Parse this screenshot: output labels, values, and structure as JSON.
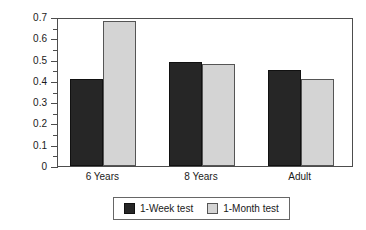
{
  "chart_data": {
    "type": "bar",
    "title": "",
    "subtitle": "",
    "xlabel": "",
    "ylabel": "False-Recall Probability",
    "categories": [
      "6 Years",
      "8 Years",
      "Adult"
    ],
    "series": [
      {
        "name": "1-Week test",
        "color": "#262626",
        "values": [
          0.41,
          0.49,
          0.45
        ]
      },
      {
        "name": "1-Month test",
        "color": "#d4d4d4",
        "values": [
          0.68,
          0.48,
          0.41
        ]
      }
    ],
    "ylim": [
      0,
      0.7
    ],
    "ytick_values": [
      0,
      0.1,
      0.2,
      0.3,
      0.4,
      0.5,
      0.6,
      0.7
    ],
    "ytick_labels": [
      "0",
      "0.1",
      "0.2",
      "0.3",
      "0.4",
      "0.5",
      "0.6",
      "0.7"
    ],
    "yminor_values": [
      0.05,
      0.15,
      0.25,
      0.35,
      0.45,
      0.55,
      0.65
    ],
    "ytick_interval": 0.1,
    "yminor_interval": 0.05,
    "grid": false,
    "legend_position": "bottom",
    "frame": "box",
    "orientation": "vertical",
    "grouping": "grouped",
    "annotations": []
  },
  "legend": {
    "entries": [
      {
        "label": "1-Week test",
        "swatch": "dark-swatch"
      },
      {
        "label": "1-Month test",
        "swatch": "light-swatch"
      }
    ]
  },
  "axes": {
    "y_title": "False-Recall Probability"
  }
}
